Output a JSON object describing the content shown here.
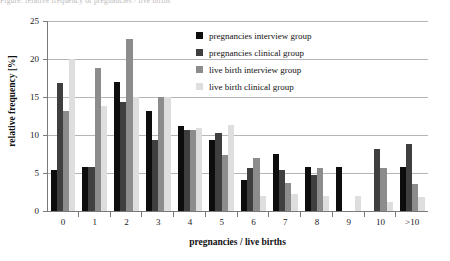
{
  "caption": {
    "text": "Figure: relative frequency of pregnancies / live births"
  },
  "chart_data": {
    "type": "bar",
    "title": "",
    "xlabel": "pregnancies / live births",
    "ylabel": "relative frequency [%]",
    "ylim": [
      0,
      25
    ],
    "yticks": [
      0,
      5,
      10,
      15,
      20,
      25
    ],
    "grid": true,
    "legend_position": "top-right",
    "categories": [
      "0",
      "1",
      "2",
      "3",
      "4",
      "5",
      "6",
      "7",
      "8",
      "9",
      "10",
      ">10"
    ],
    "series": [
      {
        "name": "pregnancies interview group",
        "color": "#0d0d0d",
        "values": [
          5.4,
          5.8,
          17.0,
          13.1,
          11.2,
          9.4,
          4.1,
          7.5,
          5.8,
          5.8,
          0.0,
          5.8
        ]
      },
      {
        "name": "pregnancies clinical group",
        "color": "#3f3f3f",
        "values": [
          16.8,
          5.8,
          14.3,
          9.3,
          10.7,
          10.3,
          5.7,
          5.4,
          4.7,
          0.0,
          8.1,
          8.8
        ]
      },
      {
        "name": "live birth interview group",
        "color": "#8c8c8c",
        "values": [
          13.2,
          18.8,
          22.6,
          15.0,
          10.6,
          7.4,
          7.0,
          3.7,
          5.6,
          0.0,
          5.6,
          3.6
        ]
      },
      {
        "name": "live birth clinical group",
        "color": "#dedede",
        "values": [
          20.0,
          13.8,
          15.0,
          15.0,
          10.9,
          11.3,
          2.0,
          2.3,
          2.0,
          2.0,
          1.2,
          1.8
        ]
      }
    ]
  }
}
